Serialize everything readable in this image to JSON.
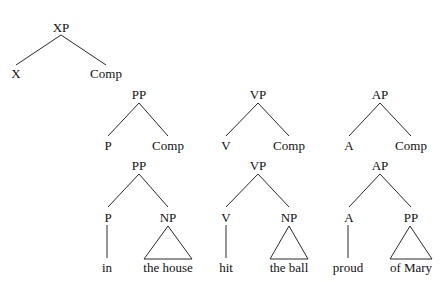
{
  "colors": {
    "line": "#2a2a2a",
    "text": "#111111",
    "background": "#ffffff"
  },
  "trees": {
    "schema": {
      "root": "XP",
      "head": "X",
      "comp": "Comp"
    },
    "pp_schema": {
      "root": "PP",
      "head": "P",
      "comp": "Comp"
    },
    "vp_schema": {
      "root": "VP",
      "head": "V",
      "comp": "Comp"
    },
    "ap_schema": {
      "root": "AP",
      "head": "A",
      "comp": "Comp"
    },
    "pp_example": {
      "root": "PP",
      "head": "P",
      "comp": "NP",
      "head_word": "in",
      "comp_words": "the house"
    },
    "vp_example": {
      "root": "VP",
      "head": "V",
      "comp": "NP",
      "head_word": "hit",
      "comp_words": "the ball"
    },
    "ap_example": {
      "root": "AP",
      "head": "A",
      "comp": "PP",
      "head_word": "proud",
      "comp_words": "of Mary"
    }
  }
}
